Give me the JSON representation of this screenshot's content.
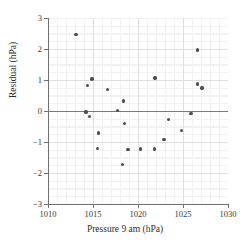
{
  "chart_data": {
    "type": "scatter",
    "title": "",
    "xlabel": "Pressure 9 am (hPa)",
    "ylabel": "Residual (hPa)",
    "xlim": [
      1010,
      1030
    ],
    "ylim": [
      -3,
      3
    ],
    "xticks": [
      1010,
      1015,
      1020,
      1025,
      1030
    ],
    "yticks": [
      3,
      2,
      1,
      0,
      -1,
      -2,
      -3
    ],
    "xtick_labels": [
      "1010",
      "1015",
      "1020",
      "1025",
      "1030"
    ],
    "ytick_labels": [
      "3",
      "2",
      "1",
      "0",
      "−1",
      "−2",
      "−3"
    ],
    "grid": true,
    "grid_minor": true,
    "legend": "none",
    "reference_line_y": 0,
    "marker_color": "#4c4c4c",
    "grid_color": "#dddde2",
    "axis_color": "#6f6f6f",
    "points": [
      {
        "x": 1013.1,
        "y": 2.47
      },
      {
        "x": 1014.4,
        "y": 0.83
      },
      {
        "x": 1014.2,
        "y": -0.03
      },
      {
        "x": 1014.6,
        "y": -0.17
      },
      {
        "x": 1014.9,
        "y": 1.03
      },
      {
        "x": 1015.6,
        "y": -0.71
      },
      {
        "x": 1015.5,
        "y": -1.21
      },
      {
        "x": 1016.6,
        "y": 0.69
      },
      {
        "x": 1017.7,
        "y": 0.01
      },
      {
        "x": 1018.4,
        "y": 0.32
      },
      {
        "x": 1018.5,
        "y": -0.41
      },
      {
        "x": 1018.3,
        "y": -1.73
      },
      {
        "x": 1018.9,
        "y": -1.25
      },
      {
        "x": 1020.3,
        "y": -1.22
      },
      {
        "x": 1021.9,
        "y": 1.06
      },
      {
        "x": 1021.8,
        "y": -1.22
      },
      {
        "x": 1022.9,
        "y": -0.92
      },
      {
        "x": 1023.4,
        "y": -0.27
      },
      {
        "x": 1024.8,
        "y": -0.62
      },
      {
        "x": 1025.9,
        "y": -0.09
      },
      {
        "x": 1026.6,
        "y": 1.97
      },
      {
        "x": 1026.6,
        "y": 0.87
      },
      {
        "x": 1027.1,
        "y": 0.74
      }
    ]
  }
}
